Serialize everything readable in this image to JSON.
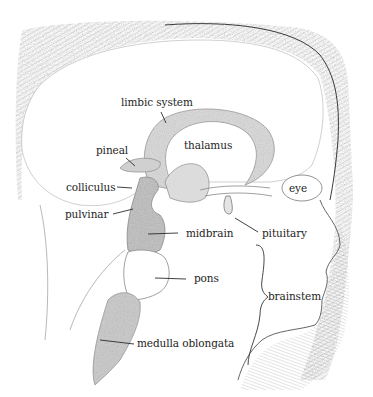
{
  "figure": {
    "ink_color": "#2b2b2b",
    "shade_color": "#9a9a9a",
    "background": "#ffffff"
  },
  "labels": {
    "limbic_system": "limbic system",
    "thalamus": "thalamus",
    "pineal": "pineal",
    "colliculus": "colliculus",
    "eye": "eye",
    "pulvinar": "pulvinar",
    "midbrain": "midbrain",
    "pituitary": "pituitary",
    "pons": "pons",
    "brainstem": "brainstem",
    "medulla_oblongata": "medulla oblongata"
  }
}
